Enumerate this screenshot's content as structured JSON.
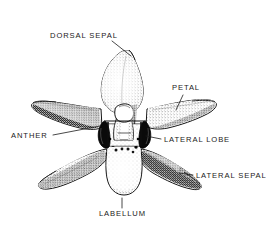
{
  "figure": {
    "background_color": "#ffffff",
    "ink_color": "#1a1a1a",
    "style": "stippled pen-and-ink botanical illustration"
  },
  "labels": [
    {
      "id": "dorsal-sepal",
      "text": "DORSAL SEPAL",
      "text_x": 50,
      "text_y": 38,
      "anchor": "start",
      "leader": "M 112 41 L 131 56"
    },
    {
      "id": "petal",
      "text": "PETAL",
      "text_x": 172,
      "text_y": 90,
      "anchor": "start",
      "leader": "M 183 95 L 176 110"
    },
    {
      "id": "anther",
      "text": "ANTHER",
      "text_x": 11,
      "text_y": 138,
      "anchor": "start",
      "leader": "M 53 135 L 100 126"
    },
    {
      "id": "lateral-lobe",
      "text": "LATERAL LOBE",
      "text_x": 164,
      "text_y": 142,
      "anchor": "start",
      "leader": "M 161 139 L 146 136"
    },
    {
      "id": "lateral-sepal",
      "text": "LATERAL SEPAL",
      "text_x": 196,
      "text_y": 178,
      "anchor": "start",
      "leader": "M 193 175 L 179 173"
    },
    {
      "id": "labellum",
      "text": "LABELLUM",
      "text_x": 99,
      "text_y": 216,
      "anchor": "start",
      "leader": "M 122 198 L 122 208"
    }
  ],
  "parts": [
    {
      "id": "dorsal-sepal-shape",
      "name": "dorsal sepal"
    },
    {
      "id": "left-petal-shape",
      "name": "left petal"
    },
    {
      "id": "right-petal-shape",
      "name": "right petal"
    },
    {
      "id": "left-lateral-sepal-shape",
      "name": "left lateral sepal"
    },
    {
      "id": "right-lateral-sepal-shape",
      "name": "right lateral sepal"
    },
    {
      "id": "labellum-shape",
      "name": "labellum"
    },
    {
      "id": "column-shape",
      "name": "column"
    },
    {
      "id": "anther-cap-shape",
      "name": "anther cap"
    },
    {
      "id": "left-lateral-lobe-shape",
      "name": "left lateral lobe"
    },
    {
      "id": "right-lateral-lobe-shape",
      "name": "right lateral lobe"
    }
  ]
}
